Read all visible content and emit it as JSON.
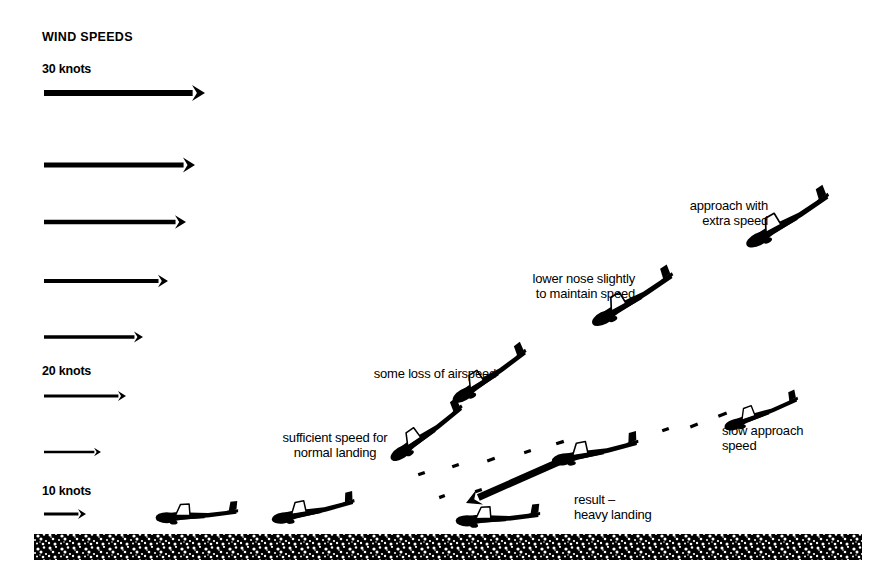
{
  "title": "WIND SPEEDS",
  "colors": {
    "ink": "#000000",
    "background": "#ffffff",
    "ground": "#1a1a1a"
  },
  "wind": {
    "heading": "WIND SPEEDS",
    "speed_labels": [
      {
        "text": "30 knots",
        "x": 42,
        "y": 62
      },
      {
        "text": "20 knots",
        "x": 42,
        "y": 364
      },
      {
        "text": "10 knots",
        "x": 42,
        "y": 484
      }
    ],
    "arrows": [
      {
        "id": "arrow-30-knots",
        "x1": 44,
        "y": 93,
        "x2": 205,
        "thickness": 6.0,
        "head": 13
      },
      {
        "id": "arrow-2",
        "x1": 44,
        "y": 165,
        "x2": 195,
        "thickness": 5.2,
        "head": 12
      },
      {
        "id": "arrow-3",
        "x1": 44,
        "y": 222,
        "x2": 186,
        "thickness": 4.6,
        "head": 11
      },
      {
        "id": "arrow-4",
        "x1": 44,
        "y": 281,
        "x2": 168,
        "thickness": 4.0,
        "head": 10
      },
      {
        "id": "arrow-5",
        "x1": 44,
        "y": 337,
        "x2": 143,
        "thickness": 3.4,
        "head": 9
      },
      {
        "id": "arrow-20-knots",
        "x1": 44,
        "y": 396,
        "x2": 126,
        "thickness": 2.8,
        "head": 8
      },
      {
        "id": "arrow-7",
        "x1": 44,
        "y": 452,
        "x2": 101,
        "thickness": 2.4,
        "head": 7
      },
      {
        "id": "arrow-10-knots",
        "x1": 44,
        "y": 514,
        "x2": 86,
        "thickness": 3.2,
        "head": 8
      }
    ]
  },
  "annotations": [
    {
      "name": "approach-with-extra-speed",
      "lines": [
        "approach with",
        "extra speed"
      ],
      "x": 648,
      "y": 198,
      "width": 120,
      "align": "right"
    },
    {
      "name": "lower-nose-slightly",
      "lines": [
        "lower nose slightly",
        "to maintain speed"
      ],
      "x": 487,
      "y": 271,
      "width": 148,
      "align": "right"
    },
    {
      "name": "some-loss-of-airspeed",
      "lines": [
        "some loss of airspeed"
      ],
      "x": 344,
      "y": 366,
      "width": 152,
      "align": "right"
    },
    {
      "name": "sufficient-speed-for-normal-landing",
      "lines": [
        "sufficient speed for",
        "normal landing"
      ],
      "x": 266,
      "y": 430,
      "width": 138,
      "align": "center"
    },
    {
      "name": "slow-approach-speed",
      "lines": [
        "slow approach",
        "speed"
      ],
      "x": 722,
      "y": 423,
      "width": 120,
      "align": "left"
    },
    {
      "name": "result-heavy-landing",
      "lines": [
        "result –",
        "heavy landing"
      ],
      "x": 574,
      "y": 492,
      "width": 120,
      "align": "left"
    }
  ],
  "gliders": [
    {
      "name": "glider-approach-extra-speed",
      "x": 786,
      "y": 219,
      "scale": 1.0,
      "rotate": -27
    },
    {
      "name": "glider-lower-nose",
      "x": 631,
      "y": 298,
      "scale": 0.98,
      "rotate": -27
    },
    {
      "name": "glider-some-loss-airspeed",
      "x": 488,
      "y": 375,
      "scale": 0.92,
      "rotate": -30
    },
    {
      "name": "glider-sufficient-speed",
      "x": 425,
      "y": 432,
      "scale": 0.92,
      "rotate": -32
    },
    {
      "name": "glider-landed-left",
      "x": 196,
      "y": 513,
      "scale": 0.86,
      "rotate": 0
    },
    {
      "name": "glider-landed-flare",
      "x": 312,
      "y": 509,
      "scale": 0.88,
      "rotate": -8
    },
    {
      "name": "glider-slow-approach",
      "x": 760,
      "y": 412,
      "scale": 0.82,
      "rotate": -17
    },
    {
      "name": "glider-heavy-landing-path",
      "x": 594,
      "y": 450,
      "scale": 0.92,
      "rotate": -8
    },
    {
      "name": "glider-heavy-landing-ground",
      "x": 497,
      "y": 516,
      "scale": 0.88,
      "rotate": 0
    }
  ],
  "descent_path": {
    "name": "heavy-landing-descent-path",
    "dashes": [
      {
        "x": 718,
        "y": 413,
        "w": 9,
        "a": -22
      },
      {
        "x": 690,
        "y": 424,
        "w": 8,
        "a": -22
      },
      {
        "x": 662,
        "y": 428,
        "w": 7,
        "a": -20
      },
      {
        "x": 556,
        "y": 441,
        "w": 8,
        "a": -18
      },
      {
        "x": 524,
        "y": 450,
        "w": 7,
        "a": -18
      },
      {
        "x": 487,
        "y": 458,
        "w": 8,
        "a": -20
      },
      {
        "x": 452,
        "y": 464,
        "w": 7,
        "a": -20
      },
      {
        "x": 418,
        "y": 472,
        "w": 7,
        "a": -20
      },
      {
        "x": 475,
        "y": 489,
        "w": 7,
        "a": -20
      },
      {
        "x": 439,
        "y": 495,
        "w": 6,
        "a": -20
      }
    ],
    "arrow": {
      "x1": 570,
      "y1": 457,
      "x2": 466,
      "y2": 503,
      "thickness": 7,
      "head": 15
    }
  },
  "ground": {
    "name": "ground-strip",
    "top": 534,
    "height": 26,
    "x": 34,
    "width": 828
  }
}
